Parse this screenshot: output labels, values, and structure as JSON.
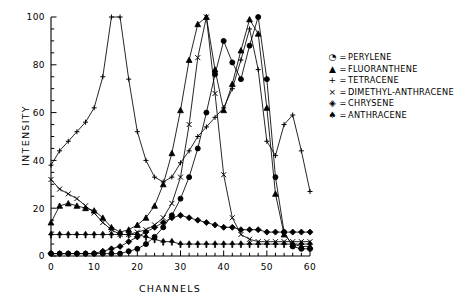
{
  "chart_data": {
    "type": "line",
    "title": "",
    "xlabel": "CHANNELS",
    "ylabel": "INTENSITY",
    "xlim": [
      0,
      60
    ],
    "ylim": [
      0,
      100
    ],
    "xticks": [
      0,
      10,
      20,
      30,
      40,
      50,
      60
    ],
    "yticks": [
      0,
      20,
      40,
      60,
      80,
      100
    ],
    "xtick_labels": [
      "0",
      "10",
      "20",
      "30",
      "40",
      "50",
      "60"
    ],
    "ytick_labels": [
      "0",
      "20",
      "40",
      "60",
      "80",
      "100"
    ],
    "x_minor_tick_step": 2,
    "y_minor_tick_step": 5,
    "grid": false,
    "legend_position": "right-outside",
    "series": [
      {
        "name": "PERYLENE",
        "marker": "circle-dot",
        "x": [
          0,
          2,
          4,
          6,
          8,
          10,
          12,
          14,
          16,
          18,
          20,
          22,
          24,
          26,
          28,
          30,
          32,
          34,
          36,
          38,
          40,
          42,
          44,
          46,
          48,
          50,
          52,
          54,
          56,
          58,
          60
        ],
        "values": [
          1,
          1,
          1,
          1,
          1,
          1,
          1,
          1,
          1,
          2,
          3,
          5,
          8,
          12,
          17,
          24,
          33,
          45,
          60,
          76,
          90,
          81,
          74,
          88,
          100,
          74,
          33,
          10,
          4,
          3,
          3
        ]
      },
      {
        "name": "FLUORANTHENE",
        "marker": "triangle-up",
        "x": [
          0,
          2,
          4,
          6,
          8,
          10,
          12,
          14,
          16,
          18,
          20,
          22,
          24,
          26,
          28,
          30,
          32,
          34,
          36,
          38,
          40,
          42,
          44,
          46,
          48,
          50,
          52,
          54,
          56,
          58,
          60
        ],
        "values": [
          14,
          21,
          22,
          21,
          20,
          19,
          16,
          12,
          10,
          11,
          13,
          16,
          21,
          30,
          43,
          61,
          82,
          97,
          100,
          78,
          61,
          72,
          86,
          99,
          93,
          62,
          26,
          9,
          5,
          4,
          4
        ]
      },
      {
        "name": "TETRACENE",
        "marker": "plus",
        "x": [
          0,
          2,
          4,
          6,
          8,
          10,
          12,
          14,
          16,
          18,
          20,
          22,
          24,
          26,
          28,
          30,
          32,
          34,
          36,
          38,
          40,
          42,
          44,
          46,
          48,
          50,
          52,
          54,
          56,
          58,
          60
        ],
        "values": [
          38,
          44,
          48,
          52,
          56,
          62,
          75,
          100,
          100,
          74,
          52,
          40,
          33,
          31,
          33,
          39,
          44,
          50,
          54,
          58,
          62,
          70,
          82,
          95,
          78,
          48,
          42,
          55,
          59,
          44,
          27
        ]
      },
      {
        "name": "DIMETHYL-ANTHRACENE",
        "marker": "cross",
        "x": [
          0,
          2,
          4,
          6,
          8,
          10,
          12,
          14,
          16,
          18,
          20,
          22,
          24,
          26,
          28,
          30,
          32,
          34,
          36,
          38,
          40,
          42,
          44,
          46,
          48,
          50,
          52,
          54,
          56,
          58,
          60
        ],
        "values": [
          32,
          28,
          26,
          24,
          21,
          18,
          14,
          11,
          9,
          9,
          10,
          11,
          13,
          16,
          22,
          33,
          55,
          83,
          100,
          68,
          34,
          16,
          9,
          7,
          6,
          6,
          6,
          6,
          6,
          6,
          6
        ]
      },
      {
        "name": "CHRYSENE",
        "marker": "diamond",
        "x": [
          0,
          2,
          4,
          6,
          8,
          10,
          12,
          14,
          16,
          18,
          20,
          22,
          24,
          26,
          28,
          30,
          32,
          34,
          36,
          38,
          40,
          42,
          44,
          46,
          48,
          50,
          52,
          54,
          56,
          58,
          60
        ],
        "values": [
          1,
          1,
          1,
          1,
          1,
          1,
          2,
          3,
          4,
          6,
          8,
          10,
          12,
          14,
          16,
          17,
          16,
          15,
          14,
          13,
          12,
          12,
          11,
          11,
          11,
          10,
          10,
          10,
          10,
          10,
          10
        ]
      },
      {
        "name": "ANTHRACENE",
        "marker": "arrow-up",
        "x": [
          0,
          2,
          4,
          6,
          8,
          10,
          12,
          14,
          16,
          18,
          20,
          22,
          24,
          26,
          28,
          30,
          32,
          34,
          36,
          38,
          40,
          42,
          44,
          46,
          48,
          50,
          52,
          54,
          56,
          58,
          60
        ],
        "values": [
          9,
          9,
          9,
          9,
          9,
          9,
          9,
          9,
          9,
          9,
          9,
          8,
          7,
          6,
          6,
          5,
          5,
          5,
          5,
          5,
          5,
          5,
          5,
          5,
          5,
          5,
          5,
          5,
          5,
          5,
          5
        ]
      }
    ]
  },
  "legend": {
    "items": [
      {
        "symbol": "◔",
        "eq": "=",
        "label": "PERYLENE"
      },
      {
        "symbol": "▲",
        "eq": "=",
        "label": "FLUORANTHENE"
      },
      {
        "symbol": "+",
        "eq": "=",
        "label": "TETRACENE"
      },
      {
        "symbol": "×",
        "eq": "=",
        "label": "DIMETHYL-ANTHRACENE"
      },
      {
        "symbol": "◈",
        "eq": "=",
        "label": "CHRYSENE"
      },
      {
        "symbol": "♠",
        "eq": "=",
        "label": "ANTHRACENE"
      }
    ]
  },
  "colors": {
    "line": "#000000",
    "axis": "#000000",
    "background": "#ffffff"
  }
}
